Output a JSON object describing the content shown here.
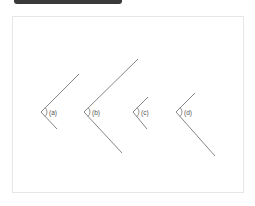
{
  "header": {
    "title": ""
  },
  "colors": {
    "line": "#777777",
    "frame": "#e6e6e6",
    "header_bar": "#3a3a3a"
  },
  "angles": [
    {
      "label": "(a)",
      "vertex": [
        41,
        112
      ],
      "upper_end": [
        79,
        74
      ],
      "lower_end": [
        57,
        129
      ]
    },
    {
      "label": "(b)",
      "vertex": [
        84,
        112
      ],
      "upper_end": [
        138,
        59
      ],
      "lower_end": [
        122,
        153
      ]
    },
    {
      "label": "(c)",
      "vertex": [
        133,
        112
      ],
      "upper_end": [
        148,
        97
      ],
      "lower_end": [
        147,
        129
      ]
    },
    {
      "label": "(d)",
      "vertex": [
        176,
        112
      ],
      "upper_end": [
        195,
        93
      ],
      "lower_end": [
        215,
        156
      ]
    }
  ]
}
